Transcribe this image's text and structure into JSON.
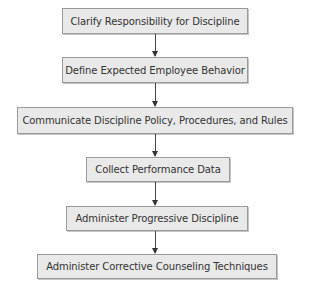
{
  "flowchart": {
    "steps": [
      {
        "label": "Clarify Responsibility for Discipline"
      },
      {
        "label": "Define Expected Employee Behavior"
      },
      {
        "label": "Communicate Discipline Policy, Procedures, and Rules"
      },
      {
        "label": "Collect Performance Data"
      },
      {
        "label": "Administer Progressive Discipline"
      },
      {
        "label": "Administer Corrective Counseling Techniques"
      }
    ],
    "colors": {
      "box_fill": "#e9e9e9",
      "box_border": "#9a9a9a",
      "arrow": "#333333"
    }
  }
}
